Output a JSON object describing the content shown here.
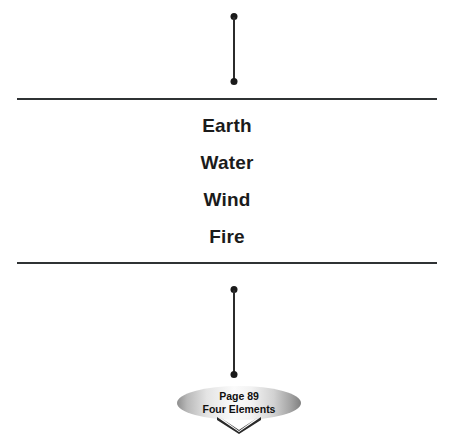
{
  "diagram": {
    "elements": {
      "items": [
        {
          "label": "Earth"
        },
        {
          "label": "Water"
        },
        {
          "label": "Wind"
        },
        {
          "label": "Fire"
        }
      ]
    },
    "badge": {
      "page_label": "Page 89",
      "title_label": "Four Elements"
    },
    "colors": {
      "rule": "#2f3234",
      "connector": "#1a1a1a",
      "text": "#1b1b1b",
      "background": "#ffffff",
      "badge_fill_light": "#fbfbfb",
      "badge_fill_dark": "#8e8e8e",
      "chevron": "#2a2a2a"
    }
  }
}
